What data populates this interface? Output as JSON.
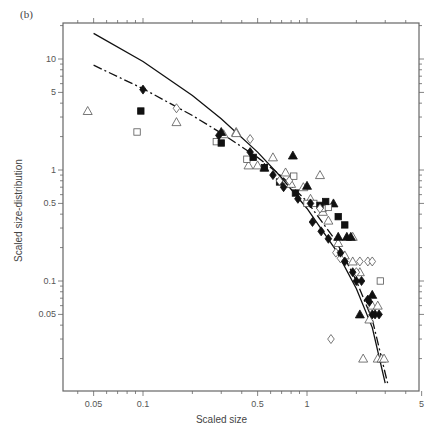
{
  "panel_label": "(b)",
  "chart_data": {
    "type": "scatter",
    "title": "",
    "xlabel": "Scaled size",
    "ylabel": "Scaled size-distribution",
    "xscale": "log",
    "yscale": "log",
    "xlim": [
      0.04,
      5
    ],
    "ylim": [
      0.012,
      20
    ],
    "x_ticks": [
      0.05,
      0.1,
      0.5,
      1,
      5
    ],
    "x_tick_labels": [
      "0.05",
      "0.1",
      "0.5",
      "1",
      "5"
    ],
    "y_ticks": [
      0.05,
      0.1,
      0.5,
      1,
      5,
      10
    ],
    "y_tick_labels": [
      "0.05",
      "0.1",
      "0.5",
      "1",
      "5",
      "10"
    ],
    "grid": false,
    "legend": null,
    "series": [
      {
        "name": "open triangles",
        "marker": "triangle-open",
        "points": [
          [
            0.046,
            3.4
          ],
          [
            0.16,
            2.7
          ],
          [
            0.31,
            2.1
          ],
          [
            0.37,
            2.2
          ],
          [
            0.44,
            1.1
          ],
          [
            0.5,
            1.1
          ],
          [
            0.62,
            1.3
          ],
          [
            0.74,
            0.95
          ],
          [
            0.8,
            0.75
          ],
          [
            0.95,
            0.7
          ],
          [
            1.05,
            0.55
          ],
          [
            1.25,
            0.42
          ],
          [
            1.35,
            0.35
          ],
          [
            1.55,
            0.22
          ],
          [
            1.7,
            0.17
          ],
          [
            1.9,
            0.25
          ],
          [
            1.9,
            0.15
          ],
          [
            2.1,
            0.12
          ],
          [
            2.5,
            0.06
          ],
          [
            2.4,
            0.045
          ],
          [
            2.7,
            0.06
          ],
          [
            2.2,
            0.02
          ],
          [
            2.7,
            0.02
          ],
          [
            2.85,
            0.02
          ],
          [
            2.95,
            0.02
          ],
          [
            0.37,
            2.15
          ],
          [
            1.2,
            0.9
          ]
        ]
      },
      {
        "name": "filled triangles",
        "marker": "triangle-filled",
        "points": [
          [
            0.3,
            2.2
          ],
          [
            0.82,
            1.35
          ],
          [
            1.0,
            0.72
          ],
          [
            1.45,
            0.5
          ],
          [
            1.55,
            0.25
          ],
          [
            1.75,
            0.25
          ],
          [
            1.85,
            0.25
          ],
          [
            2.1,
            0.05
          ],
          [
            2.5,
            0.075
          ],
          [
            0.55,
            1.05
          ]
        ]
      },
      {
        "name": "open squares",
        "marker": "square-open",
        "points": [
          [
            0.092,
            2.2
          ],
          [
            0.28,
            1.8
          ],
          [
            0.43,
            1.25
          ],
          [
            0.83,
            0.88
          ],
          [
            1.0,
            0.5
          ],
          [
            1.1,
            0.5
          ],
          [
            1.25,
            0.45
          ],
          [
            1.35,
            0.46
          ],
          [
            2.8,
            0.1
          ]
        ]
      },
      {
        "name": "filled squares",
        "marker": "square-filled",
        "points": [
          [
            0.097,
            3.4
          ],
          [
            0.3,
            1.75
          ],
          [
            0.47,
            1.3
          ],
          [
            0.55,
            1.05
          ],
          [
            0.68,
            0.78
          ],
          [
            0.85,
            0.62
          ],
          [
            1.2,
            0.48
          ],
          [
            1.3,
            0.52
          ],
          [
            1.55,
            0.38
          ],
          [
            1.7,
            0.32
          ]
        ]
      },
      {
        "name": "open diamonds",
        "marker": "diamond-open",
        "points": [
          [
            0.16,
            3.6
          ],
          [
            0.45,
            1.9
          ],
          [
            0.78,
            0.8
          ],
          [
            0.68,
            0.8
          ],
          [
            1.2,
            0.45
          ],
          [
            1.5,
            0.18
          ],
          [
            1.6,
            0.16
          ],
          [
            2.0,
            0.12
          ],
          [
            2.1,
            0.15
          ],
          [
            2.35,
            0.15
          ],
          [
            2.5,
            0.15
          ],
          [
            1.4,
            0.03
          ]
        ]
      },
      {
        "name": "filled diamonds",
        "marker": "diamond-filled",
        "points": [
          [
            0.1,
            5.3
          ],
          [
            0.29,
            2.05
          ],
          [
            0.45,
            1.45
          ],
          [
            0.62,
            0.9
          ],
          [
            0.72,
            0.7
          ],
          [
            0.88,
            0.55
          ],
          [
            1.05,
            0.5
          ],
          [
            1.08,
            0.34
          ],
          [
            1.22,
            0.28
          ],
          [
            1.35,
            0.24
          ],
          [
            1.6,
            0.18
          ],
          [
            1.7,
            0.15
          ],
          [
            1.9,
            0.12
          ],
          [
            2.0,
            0.1
          ],
          [
            2.15,
            0.1
          ],
          [
            2.35,
            0.068
          ],
          [
            2.4,
            0.065
          ],
          [
            2.5,
            0.05
          ],
          [
            2.6,
            0.05
          ],
          [
            2.75,
            0.05
          ]
        ]
      },
      {
        "name": "solid curve",
        "marker": "line-solid",
        "points": [
          [
            0.05,
            17
          ],
          [
            0.1,
            9.5
          ],
          [
            0.2,
            4.7
          ],
          [
            0.3,
            2.9
          ],
          [
            0.5,
            1.45
          ],
          [
            0.7,
            0.85
          ],
          [
            1.0,
            0.45
          ],
          [
            1.5,
            0.19
          ],
          [
            2.0,
            0.085
          ],
          [
            2.5,
            0.038
          ],
          [
            3.0,
            0.012
          ]
        ]
      },
      {
        "name": "dash-dot curve",
        "marker": "line-dashdot",
        "points": [
          [
            0.05,
            8.8
          ],
          [
            0.1,
            5.4
          ],
          [
            0.2,
            3.1
          ],
          [
            0.3,
            2.15
          ],
          [
            0.5,
            1.3
          ],
          [
            0.7,
            0.88
          ],
          [
            1.0,
            0.52
          ],
          [
            1.5,
            0.23
          ],
          [
            2.0,
            0.1
          ],
          [
            2.5,
            0.045
          ],
          [
            3.1,
            0.012
          ]
        ]
      }
    ]
  },
  "caption_partial": ""
}
